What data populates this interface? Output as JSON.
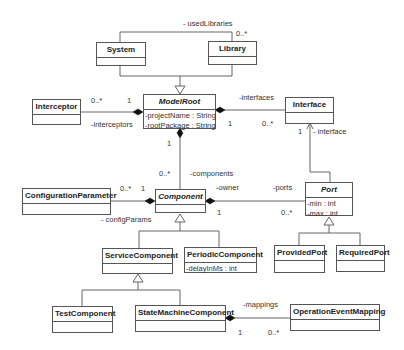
{
  "classes": {
    "system": {
      "name": "System",
      "attrs": []
    },
    "library": {
      "name": "Library",
      "attrs": []
    },
    "interceptor": {
      "name": "Interceptor",
      "attrs": []
    },
    "model_root": {
      "name": "ModelRoot",
      "abstract": true,
      "attrs": [
        "-projectName : String",
        "-rootPackage : String"
      ]
    },
    "interface": {
      "name": "Interface",
      "attrs": []
    },
    "configuration_parameter": {
      "name": "ConfigurationParameter",
      "attrs": []
    },
    "component": {
      "name": "Component",
      "abstract": true,
      "attrs": []
    },
    "port": {
      "name": "Port",
      "abstract": true,
      "attrs": [
        "-min : int",
        "-max : int"
      ]
    },
    "service_component": {
      "name": "ServiceComponent",
      "attrs": []
    },
    "periodic_component": {
      "name": "PeriodicComponent",
      "attrs": [
        "-delayInMs : int"
      ]
    },
    "provided_port": {
      "name": "ProvidedPort",
      "attrs": []
    },
    "required_port": {
      "name": "RequiredPort",
      "attrs": []
    },
    "test_component": {
      "name": "TestComponent",
      "attrs": []
    },
    "state_machine_component": {
      "name": "StateMachineComponent",
      "attrs": []
    },
    "operation_event_mapping": {
      "name": "OperationEventMapping",
      "attrs": []
    }
  },
  "labels": {
    "used_libraries": "- usedLibraries",
    "used_libraries_mult": "0..*",
    "interceptors_role": "-interceptors",
    "interceptors_mult_many": "0..*",
    "interceptors_mult_one": "1",
    "interfaces_role": "-interfaces",
    "interfaces_mult_one": "1",
    "interfaces_mult_many": "0..*",
    "interface_role": "- interface",
    "interface_mult": "1",
    "components_role": "-components",
    "components_mult_one": "1",
    "components_mult_many": "0..*",
    "config_params_role": "- configParams",
    "config_params_mult_many": "0..*",
    "config_params_mult_one": "1",
    "owner_role": "-owner",
    "ports_role": "-ports",
    "ports_mult_one": "1",
    "ports_mult_many": "0..*",
    "mappings_role": "-mappings",
    "mappings_mult_one": "1",
    "mappings_mult_many": "0..*"
  }
}
